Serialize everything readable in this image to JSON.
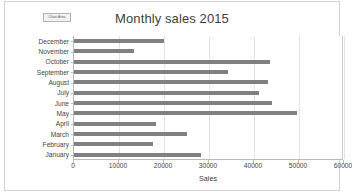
{
  "chart_area_tag": {
    "label": "Chart Area"
  },
  "chart": {
    "title": "Monthly sales 2015",
    "xlabel": "Sales"
  },
  "axis": {
    "ticks": [
      "0",
      "10000",
      "20000",
      "30000",
      "40000",
      "50000",
      "60000"
    ]
  },
  "colors": {
    "bar": "#808080",
    "gridline": "#e4e4e4",
    "axis": "#b9b9b9",
    "text": "#404040",
    "frame": "#d2d2d2"
  },
  "chart_data": {
    "type": "bar",
    "orientation": "horizontal",
    "title": "Monthly sales 2015",
    "xlabel": "Sales",
    "ylabel": "",
    "xlim": [
      0,
      60000
    ],
    "xticks": [
      0,
      10000,
      20000,
      30000,
      40000,
      50000,
      60000
    ],
    "grid": true,
    "legend": false,
    "categories": [
      "December",
      "November",
      "October",
      "September",
      "August",
      "July",
      "June",
      "May",
      "April",
      "March",
      "February",
      "January"
    ],
    "values": [
      20000,
      13400,
      43500,
      34300,
      43000,
      41000,
      44000,
      49500,
      18300,
      25000,
      17500,
      28300
    ]
  }
}
